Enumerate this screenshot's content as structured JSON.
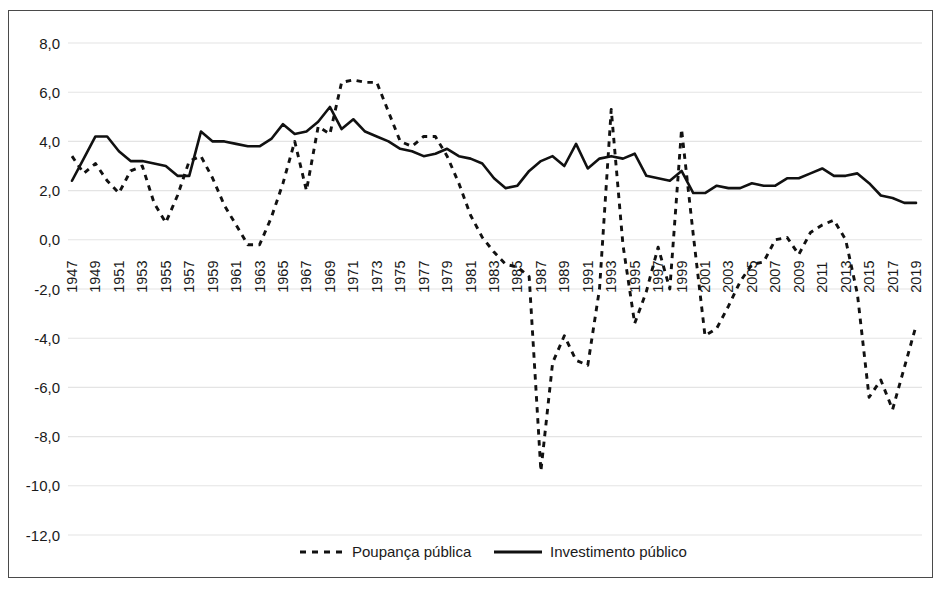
{
  "chart_data": {
    "type": "line",
    "title": "",
    "xlabel": "",
    "ylabel": "",
    "xlim": [
      1947,
      2019
    ],
    "ylim": [
      -12.0,
      8.0
    ],
    "grid": true,
    "legend_position": "bottom",
    "y_ticks": [
      "8,0",
      "6,0",
      "4,0",
      "2,0",
      "0,0",
      "-2,0",
      "-4,0",
      "-6,0",
      "-8,0",
      "-10,0",
      "-12,0"
    ],
    "y_tick_values": [
      8.0,
      6.0,
      4.0,
      2.0,
      0.0,
      -2.0,
      -4.0,
      -6.0,
      -8.0,
      -10.0,
      -12.0
    ],
    "x_tick_labels": [
      "1947",
      "1949",
      "1951",
      "1953",
      "1955",
      "1957",
      "1959",
      "1961",
      "1963",
      "1965",
      "1967",
      "1969",
      "1971",
      "1973",
      "1975",
      "1977",
      "1979",
      "1981",
      "1983",
      "1985",
      "1987",
      "1989",
      "1991",
      "1993",
      "1995",
      "1997",
      "1999",
      "2001",
      "2003",
      "2005",
      "2007",
      "2009",
      "2011",
      "2013",
      "2015",
      "2017",
      "2019"
    ],
    "x": [
      1947,
      1948,
      1949,
      1950,
      1951,
      1952,
      1953,
      1954,
      1955,
      1956,
      1957,
      1958,
      1959,
      1960,
      1961,
      1962,
      1963,
      1964,
      1965,
      1966,
      1967,
      1968,
      1969,
      1970,
      1971,
      1972,
      1973,
      1974,
      1975,
      1976,
      1977,
      1978,
      1979,
      1980,
      1981,
      1982,
      1983,
      1984,
      1985,
      1986,
      1987,
      1988,
      1989,
      1990,
      1991,
      1992,
      1993,
      1994,
      1995,
      1996,
      1997,
      1998,
      1999,
      2000,
      2001,
      2002,
      2003,
      2004,
      2005,
      2006,
      2007,
      2008,
      2009,
      2010,
      2011,
      2012,
      2013,
      2014,
      2015,
      2016,
      2017,
      2018,
      2019
    ],
    "series": [
      {
        "name": "Poupança pública",
        "style": "dashed",
        "color": "#111111",
        "values": [
          3.4,
          2.7,
          3.1,
          2.4,
          1.9,
          2.8,
          3.0,
          1.5,
          0.7,
          1.8,
          3.2,
          3.4,
          2.5,
          1.4,
          0.6,
          -0.2,
          -0.2,
          0.9,
          2.3,
          4.0,
          2.0,
          4.6,
          4.3,
          6.4,
          6.5,
          6.4,
          6.4,
          5.2,
          4.0,
          3.8,
          4.2,
          4.2,
          3.4,
          2.3,
          1.0,
          0.1,
          -0.5,
          -1.0,
          -1.1,
          -1.5,
          -9.4,
          -5.0,
          -3.9,
          -4.9,
          -5.1,
          -2.0,
          5.3,
          -0.2,
          -3.4,
          -2.1,
          -0.3,
          -2.0,
          4.5,
          0.2,
          -3.9,
          -3.6,
          -2.7,
          -1.7,
          -1.0,
          -0.9,
          0.0,
          0.1,
          -0.6,
          0.3,
          0.6,
          0.8,
          0.0,
          -2.2,
          -6.4,
          -5.7,
          -6.9,
          -5.2,
          -3.5
        ]
      },
      {
        "name": "Investimento público",
        "style": "solid",
        "color": "#111111",
        "values": [
          2.4,
          3.3,
          4.2,
          4.2,
          3.6,
          3.2,
          3.2,
          3.1,
          3.0,
          2.6,
          2.6,
          4.4,
          4.0,
          4.0,
          3.9,
          3.8,
          3.8,
          4.1,
          4.7,
          4.3,
          4.4,
          4.8,
          5.4,
          4.5,
          4.9,
          4.4,
          4.2,
          4.0,
          3.7,
          3.6,
          3.4,
          3.5,
          3.7,
          3.4,
          3.3,
          3.1,
          2.5,
          2.1,
          2.2,
          2.8,
          3.2,
          3.4,
          3.0,
          3.9,
          2.9,
          3.3,
          3.4,
          3.3,
          3.5,
          2.6,
          2.5,
          2.4,
          2.8,
          1.9,
          1.9,
          2.2,
          2.1,
          2.1,
          2.3,
          2.2,
          2.2,
          2.5,
          2.5,
          2.7,
          2.9,
          2.6,
          2.6,
          2.7,
          2.3,
          1.8,
          1.7,
          1.5,
          1.5
        ]
      }
    ]
  },
  "legend": {
    "items": [
      {
        "label": "Poupança pública",
        "style": "dashed"
      },
      {
        "label": "Investimento público",
        "style": "solid"
      }
    ]
  }
}
